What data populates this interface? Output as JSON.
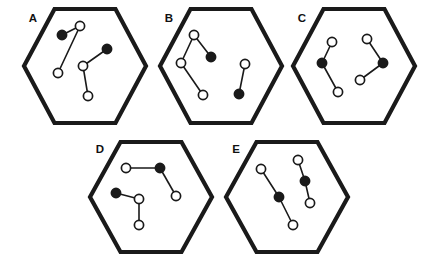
{
  "figure": {
    "background_color": "#ffffff",
    "outline_color": "#1a1a1a",
    "node_filled_color": "#1a1a1a",
    "node_open_color": "#ffffff",
    "edge_color": "#1a1a1a",
    "panel_count": 5,
    "node_radius_open": 4.6,
    "node_radius_filled": 4.6,
    "hex_stroke_width": 4.2,
    "edge_stroke_width": 1.6
  },
  "panels": [
    {
      "id": "A",
      "label": "A",
      "label_pos": {
        "x": 33,
        "y": 19
      },
      "hexagon": {
        "cx": 85,
        "cy": 66,
        "rx": 61,
        "ry": 57
      },
      "nodes": [
        {
          "id": "a1",
          "x": 62,
          "y": 35,
          "type": "filled"
        },
        {
          "id": "a2",
          "x": 80,
          "y": 26,
          "type": "open"
        },
        {
          "id": "a3",
          "x": 58,
          "y": 73,
          "type": "open"
        },
        {
          "id": "a4",
          "x": 83,
          "y": 66,
          "type": "open"
        },
        {
          "id": "a5",
          "x": 107,
          "y": 49,
          "type": "filled"
        },
        {
          "id": "a6",
          "x": 88,
          "y": 96,
          "type": "open"
        }
      ],
      "edges": [
        {
          "from": "a1",
          "to": "a2"
        },
        {
          "from": "a2",
          "to": "a3"
        },
        {
          "from": "a4",
          "to": "a5"
        },
        {
          "from": "a4",
          "to": "a6"
        }
      ]
    },
    {
      "id": "B",
      "label": "B",
      "label_pos": {
        "x": 169,
        "y": 19
      },
      "hexagon": {
        "cx": 221,
        "cy": 66,
        "rx": 61,
        "ry": 57
      },
      "nodes": [
        {
          "id": "b1",
          "x": 194,
          "y": 35,
          "type": "open"
        },
        {
          "id": "b2",
          "x": 211,
          "y": 57,
          "type": "filled"
        },
        {
          "id": "b3",
          "x": 181,
          "y": 63,
          "type": "open"
        },
        {
          "id": "b4",
          "x": 203,
          "y": 95,
          "type": "open"
        },
        {
          "id": "b5",
          "x": 245,
          "y": 64,
          "type": "open"
        },
        {
          "id": "b6",
          "x": 239,
          "y": 94,
          "type": "filled"
        }
      ],
      "edges": [
        {
          "from": "b1",
          "to": "b2"
        },
        {
          "from": "b1",
          "to": "b3"
        },
        {
          "from": "b3",
          "to": "b4"
        },
        {
          "from": "b5",
          "to": "b6"
        }
      ]
    },
    {
      "id": "C",
      "label": "C",
      "label_pos": {
        "x": 302,
        "y": 19
      },
      "hexagon": {
        "cx": 354,
        "cy": 66,
        "rx": 61,
        "ry": 57
      },
      "nodes": [
        {
          "id": "c1",
          "x": 332,
          "y": 42,
          "type": "open"
        },
        {
          "id": "c2",
          "x": 322,
          "y": 63,
          "type": "filled"
        },
        {
          "id": "c3",
          "x": 338,
          "y": 92,
          "type": "open"
        },
        {
          "id": "c4",
          "x": 367,
          "y": 39,
          "type": "open"
        },
        {
          "id": "c5",
          "x": 383,
          "y": 63,
          "type": "filled"
        },
        {
          "id": "c6",
          "x": 360,
          "y": 80,
          "type": "open"
        }
      ],
      "edges": [
        {
          "from": "c1",
          "to": "c2"
        },
        {
          "from": "c2",
          "to": "c3"
        },
        {
          "from": "c4",
          "to": "c5"
        },
        {
          "from": "c5",
          "to": "c6"
        }
      ]
    },
    {
      "id": "D",
      "label": "D",
      "label_pos": {
        "x": 100,
        "y": 150
      },
      "hexagon": {
        "cx": 151,
        "cy": 197,
        "rx": 61,
        "ry": 55
      },
      "nodes": [
        {
          "id": "d1",
          "x": 126,
          "y": 168,
          "type": "open"
        },
        {
          "id": "d2",
          "x": 160,
          "y": 168,
          "type": "filled"
        },
        {
          "id": "d3",
          "x": 176,
          "y": 196,
          "type": "open"
        },
        {
          "id": "d4",
          "x": 116,
          "y": 193,
          "type": "filled"
        },
        {
          "id": "d5",
          "x": 139,
          "y": 199,
          "type": "open"
        },
        {
          "id": "d6",
          "x": 139,
          "y": 225,
          "type": "open"
        }
      ],
      "edges": [
        {
          "from": "d1",
          "to": "d2"
        },
        {
          "from": "d2",
          "to": "d3"
        },
        {
          "from": "d4",
          "to": "d5"
        },
        {
          "from": "d5",
          "to": "d6"
        }
      ]
    },
    {
      "id": "E",
      "label": "E",
      "label_pos": {
        "x": 236,
        "y": 150
      },
      "hexagon": {
        "cx": 287,
        "cy": 197,
        "rx": 61,
        "ry": 55
      },
      "nodes": [
        {
          "id": "e1",
          "x": 261,
          "y": 169,
          "type": "open"
        },
        {
          "id": "e2",
          "x": 279,
          "y": 197,
          "type": "filled"
        },
        {
          "id": "e3",
          "x": 293,
          "y": 225,
          "type": "open"
        },
        {
          "id": "e4",
          "x": 298,
          "y": 160,
          "type": "open"
        },
        {
          "id": "e5",
          "x": 305,
          "y": 181,
          "type": "filled"
        },
        {
          "id": "e6",
          "x": 310,
          "y": 203,
          "type": "open"
        }
      ],
      "edges": [
        {
          "from": "e1",
          "to": "e2"
        },
        {
          "from": "e2",
          "to": "e3"
        },
        {
          "from": "e4",
          "to": "e5"
        },
        {
          "from": "e5",
          "to": "e6"
        }
      ]
    }
  ]
}
